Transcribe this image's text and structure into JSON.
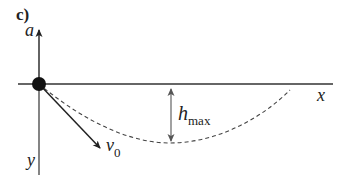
{
  "figure": {
    "panel_label": "c)",
    "axes": {
      "vertical_up_label": "a",
      "vertical_down_label": "y",
      "horizontal_label": "x"
    },
    "vectors": {
      "initial_velocity": {
        "symbol": "v",
        "subscript": "0"
      }
    },
    "annotations": {
      "max_height": {
        "symbol": "h",
        "subscript": "max"
      }
    },
    "colors": {
      "line": "#333333",
      "dot": "#111111",
      "dashed_curve": "#444444",
      "h_arrow": "#555555"
    }
  }
}
